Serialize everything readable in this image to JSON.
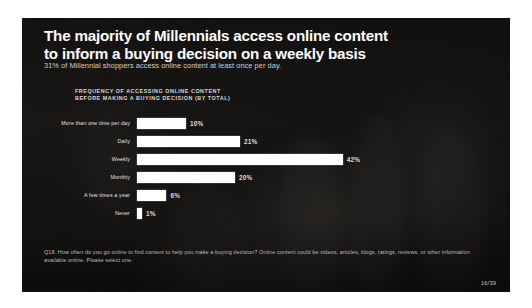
{
  "slide": {
    "headline_line1": "The majority of Millennials access online content",
    "headline_line2": "to inform a buying decision on a weekly basis",
    "subhead": "31% of Millennial shoppers access online content at least once per day.",
    "chart_title_line1": "FREQUENCY OF ACCESSING ONLINE CONTENT",
    "chart_title_line2": "BEFORE MAKING A BUYING DECISION (By Total)",
    "footnote": "Q18. How often do you go online to find content to help you make a buying decision? Online content could be videos, articles, blogs, ratings, reviews, or other information available online. Please select one.",
    "page_number": "16/39",
    "colors": {
      "slide_background": "#1a1917",
      "bar_fill": "#ffffff",
      "headline_text": "#ffffff",
      "body_text": "#cfcfcf",
      "page_frame": "#ffffff"
    }
  },
  "chart_data": {
    "type": "bar",
    "orientation": "horizontal",
    "title": "FREQUENCY OF ACCESSING ONLINE CONTENT BEFORE MAKING A BUYING DECISION (By Total)",
    "xlabel": "",
    "ylabel": "",
    "xlim": [
      0,
      45
    ],
    "grid": false,
    "legend": false,
    "value_suffix": "%",
    "categories": [
      "More than one time per day",
      "Daily",
      "Weekly",
      "Monthly",
      "A few times a year",
      "Never"
    ],
    "values": [
      10,
      21,
      42,
      20,
      6,
      1
    ],
    "labels": [
      "10%",
      "21%",
      "42%",
      "20%",
      "6%",
      "1%"
    ],
    "bars": [
      {
        "category": "More than one time per day",
        "value": 10,
        "label": "10%"
      },
      {
        "category": "Daily",
        "value": 21,
        "label": "21%"
      },
      {
        "category": "Weekly",
        "value": 42,
        "label": "42%"
      },
      {
        "category": "Monthly",
        "value": 20,
        "label": "20%"
      },
      {
        "category": "A few times a year",
        "value": 6,
        "label": "6%"
      },
      {
        "category": "Never",
        "value": 1,
        "label": "1%"
      }
    ],
    "max_value": 42,
    "pixels_per_percent": 4.9
  }
}
